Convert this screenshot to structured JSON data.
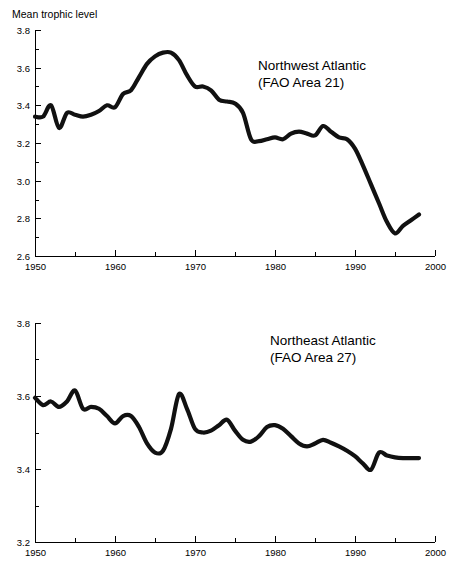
{
  "figure": {
    "y_axis_caption": "Mean trophic level",
    "background": "#ffffff",
    "line_color": "#111111"
  },
  "chart_data": [
    {
      "type": "line",
      "title": "Northwest Atlantic",
      "subtitle": "(FAO Area 21)",
      "xlabel": "",
      "ylabel": "Mean trophic level",
      "xlim": [
        1950,
        2000
      ],
      "ylim": [
        2.6,
        3.8
      ],
      "xticks": [
        1950,
        1955,
        1960,
        1965,
        1970,
        1975,
        1980,
        1985,
        1990,
        1995,
        2000
      ],
      "xtick_labels": [
        "1950",
        "",
        "1960",
        "",
        "1970",
        "",
        "1980",
        "",
        "1990",
        "",
        "2000"
      ],
      "yticks": [
        2.6,
        2.7,
        2.8,
        2.9,
        3.0,
        3.1,
        3.2,
        3.3,
        3.4,
        3.5,
        3.6,
        3.7,
        3.8
      ],
      "ytick_labels": [
        "2.6",
        "",
        "2.8",
        "",
        "3.0",
        "",
        "3.2",
        "",
        "3.4",
        "",
        "3.6",
        "",
        "3.8"
      ],
      "grid": false,
      "legend": "none",
      "x": [
        1950,
        1951,
        1952,
        1953,
        1954,
        1955,
        1956,
        1957,
        1958,
        1959,
        1960,
        1961,
        1962,
        1963,
        1964,
        1965,
        1966,
        1967,
        1968,
        1969,
        1970,
        1971,
        1972,
        1973,
        1974,
        1975,
        1976,
        1977,
        1978,
        1979,
        1980,
        1981,
        1982,
        1983,
        1984,
        1985,
        1986,
        1987,
        1988,
        1989,
        1990,
        1991,
        1992,
        1993,
        1994,
        1995,
        1996,
        1997,
        1998
      ],
      "y": [
        3.34,
        3.34,
        3.4,
        3.28,
        3.36,
        3.35,
        3.34,
        3.35,
        3.37,
        3.4,
        3.39,
        3.46,
        3.48,
        3.55,
        3.62,
        3.66,
        3.68,
        3.68,
        3.64,
        3.56,
        3.5,
        3.5,
        3.48,
        3.43,
        3.42,
        3.41,
        3.36,
        3.22,
        3.21,
        3.22,
        3.23,
        3.22,
        3.25,
        3.26,
        3.25,
        3.24,
        3.29,
        3.26,
        3.23,
        3.22,
        3.17,
        3.08,
        2.98,
        2.88,
        2.78,
        2.72,
        2.76,
        2.79,
        2.82
      ],
      "series": [
        {
          "name": "Northwest Atlantic mean trophic level",
          "values": [
            3.34,
            3.34,
            3.4,
            3.28,
            3.36,
            3.35,
            3.34,
            3.35,
            3.37,
            3.4,
            3.39,
            3.46,
            3.48,
            3.55,
            3.62,
            3.66,
            3.68,
            3.68,
            3.64,
            3.56,
            3.5,
            3.5,
            3.48,
            3.43,
            3.42,
            3.41,
            3.36,
            3.22,
            3.21,
            3.22,
            3.23,
            3.22,
            3.25,
            3.26,
            3.25,
            3.24,
            3.29,
            3.26,
            3.23,
            3.22,
            3.17,
            3.08,
            2.98,
            2.88,
            2.78,
            2.72,
            2.76,
            2.79,
            2.82
          ]
        }
      ]
    },
    {
      "type": "line",
      "title": "Northeast Atlantic",
      "subtitle": "(FAO Area 27)",
      "xlabel": "",
      "ylabel": "",
      "xlim": [
        1950,
        2000
      ],
      "ylim": [
        3.2,
        3.8
      ],
      "xticks": [
        1950,
        1955,
        1960,
        1965,
        1970,
        1975,
        1980,
        1985,
        1990,
        1995,
        2000
      ],
      "xtick_labels": [
        "1950",
        "",
        "1960",
        "",
        "1970",
        "",
        "1980",
        "",
        "1990",
        "",
        "2000"
      ],
      "yticks": [
        3.2,
        3.3,
        3.4,
        3.5,
        3.6,
        3.7,
        3.8
      ],
      "ytick_labels": [
        "3.2",
        "",
        "3.4",
        "",
        "3.6",
        "",
        "3.8"
      ],
      "grid": false,
      "legend": "none",
      "x": [
        1950,
        1951,
        1952,
        1953,
        1954,
        1955,
        1956,
        1957,
        1958,
        1959,
        1960,
        1961,
        1962,
        1963,
        1964,
        1965,
        1966,
        1967,
        1968,
        1969,
        1970,
        1971,
        1972,
        1973,
        1974,
        1975,
        1976,
        1977,
        1978,
        1979,
        1980,
        1981,
        1982,
        1983,
        1984,
        1985,
        1986,
        1987,
        1988,
        1989,
        1990,
        1991,
        1992,
        1993,
        1994,
        1995,
        1996,
        1997,
        1998
      ],
      "y": [
        3.595,
        3.575,
        3.585,
        3.57,
        3.585,
        3.615,
        3.565,
        3.57,
        3.565,
        3.545,
        3.525,
        3.545,
        3.545,
        3.515,
        3.47,
        3.445,
        3.45,
        3.51,
        3.605,
        3.565,
        3.51,
        3.5,
        3.505,
        3.52,
        3.535,
        3.505,
        3.48,
        3.475,
        3.49,
        3.515,
        3.52,
        3.51,
        3.49,
        3.47,
        3.462,
        3.47,
        3.48,
        3.472,
        3.462,
        3.45,
        3.435,
        3.415,
        3.398,
        3.445,
        3.437,
        3.432,
        3.43,
        3.43,
        3.43
      ],
      "series": [
        {
          "name": "Northeast Atlantic mean trophic level",
          "values": [
            3.595,
            3.575,
            3.585,
            3.57,
            3.585,
            3.615,
            3.565,
            3.57,
            3.565,
            3.545,
            3.525,
            3.545,
            3.545,
            3.515,
            3.47,
            3.445,
            3.45,
            3.51,
            3.605,
            3.565,
            3.51,
            3.5,
            3.505,
            3.52,
            3.535,
            3.505,
            3.48,
            3.475,
            3.49,
            3.515,
            3.52,
            3.51,
            3.49,
            3.47,
            3.462,
            3.47,
            3.48,
            3.472,
            3.462,
            3.45,
            3.435,
            3.415,
            3.398,
            3.445,
            3.437,
            3.432,
            3.43,
            3.43,
            3.43
          ]
        }
      ]
    }
  ]
}
